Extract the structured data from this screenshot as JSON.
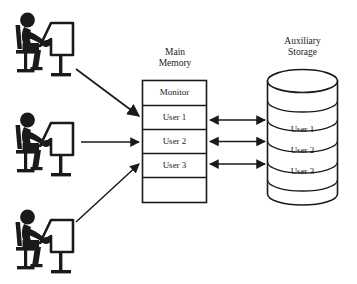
{
  "diagram": {
    "kind": "time-sharing-system-diagram",
    "background_color": "#ffffff",
    "line_color": "#1a1a1a",
    "terminals": [
      {
        "name": "terminal-user-1",
        "alt": "person seated at a computer terminal"
      },
      {
        "name": "terminal-user-2",
        "alt": "person seated at a computer terminal"
      },
      {
        "name": "terminal-user-3",
        "alt": "person seated at a computer terminal"
      }
    ],
    "main_memory": {
      "title": "Main\nMemory",
      "cells": [
        {
          "label": "Monitor"
        },
        {
          "label": "User 1"
        },
        {
          "label": "User 2"
        },
        {
          "label": "User 3"
        },
        {
          "label": ""
        }
      ]
    },
    "auxiliary_storage": {
      "title": "Auxiliary\nStorage",
      "discs": [
        {
          "label": ""
        },
        {
          "label": ""
        },
        {
          "label": "User 1"
        },
        {
          "label": "User 2"
        },
        {
          "label": "User 3"
        },
        {
          "label": ""
        }
      ]
    },
    "terminal_arrows": [
      {
        "name": "arrow-terminal-1-to-user-1",
        "direction": "one-way"
      },
      {
        "name": "arrow-terminal-2-to-user-2",
        "direction": "one-way"
      },
      {
        "name": "arrow-terminal-3-to-user-3",
        "direction": "one-way"
      }
    ],
    "transfer_arrows": [
      {
        "name": "arrow-memory-user-1-storage-user-1",
        "direction": "two-way"
      },
      {
        "name": "arrow-memory-user-2-storage-user-2",
        "direction": "two-way"
      },
      {
        "name": "arrow-memory-user-3-storage-user-3",
        "direction": "two-way"
      }
    ]
  }
}
